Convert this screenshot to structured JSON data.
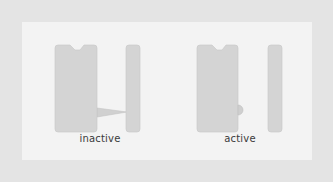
{
  "figure": {
    "colors": {
      "background": "#e4e4e4",
      "panel": "#f3f3f3",
      "block": "#d4d4d4",
      "block_edge": "#c6c6c6",
      "connector": "#d0d0d0",
      "label": "#3a3a3a"
    },
    "states": [
      {
        "id": "inactive",
        "label": "inactive",
        "connector": "wedge"
      },
      {
        "id": "active",
        "label": "active",
        "connector": "bulge"
      }
    ]
  }
}
